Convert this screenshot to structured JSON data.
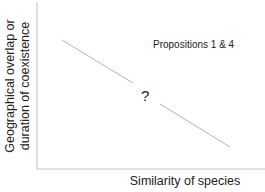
{
  "diagram": {
    "y_axis_label_lines": [
      "Geographical overlap or",
      "duration of coexistence"
    ],
    "x_axis_label": "Similarity of species",
    "annotation": "Propositions 1 & 4",
    "uncertainty_marker": "?",
    "colors": {
      "axis": "#c8c8c8",
      "trend_line": "#b4b4b4",
      "text": "#222222"
    },
    "trend": {
      "direction": "negative",
      "segments": [
        {
          "x1": 62,
          "y1": 40,
          "x2": 133,
          "y2": 83
        },
        {
          "x1": 160,
          "y1": 104,
          "x2": 230,
          "y2": 147
        }
      ]
    }
  }
}
